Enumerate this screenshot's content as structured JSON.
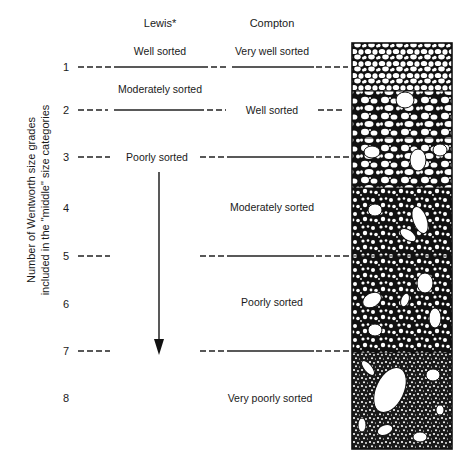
{
  "headers": {
    "lewis": "Lewis*",
    "compton": "Compton"
  },
  "y_axis_label": {
    "line1": "Number of Wentworth size grades",
    "line2": "included in the \"middle\" size categories"
  },
  "rows": [
    {
      "n": "1",
      "y": 67
    },
    {
      "n": "2",
      "y": 110
    },
    {
      "n": "3",
      "y": 157
    },
    {
      "n": "4",
      "y": 208
    },
    {
      "n": "5",
      "y": 256
    },
    {
      "n": "6",
      "y": 304
    },
    {
      "n": "7",
      "y": 351
    },
    {
      "n": "8",
      "y": 398
    }
  ],
  "lewis_labels": [
    {
      "text": "Well sorted",
      "between": "above 1"
    },
    {
      "text": "Moderately sorted",
      "between": "1-2"
    },
    {
      "text": "Poorly sorted",
      "at": "3",
      "arrow_to": "7"
    }
  ],
  "compton_labels": [
    {
      "text": "Very well sorted",
      "between": "above 1"
    },
    {
      "text": "Well sorted",
      "at": "2"
    },
    {
      "text": "Moderately sorted",
      "at": "4"
    },
    {
      "text": "Poorly sorted",
      "at": "6"
    },
    {
      "text": "Very poorly sorted",
      "at": "8"
    }
  ],
  "illustration": {
    "description": "Sediment column showing grain sorting from very well sorted (top) to very poorly sorted (bottom)",
    "sections": [
      "very well sorted",
      "well sorted",
      "moderately sorted",
      "moderately sorted",
      "poorly sorted",
      "very poorly sorted"
    ]
  }
}
